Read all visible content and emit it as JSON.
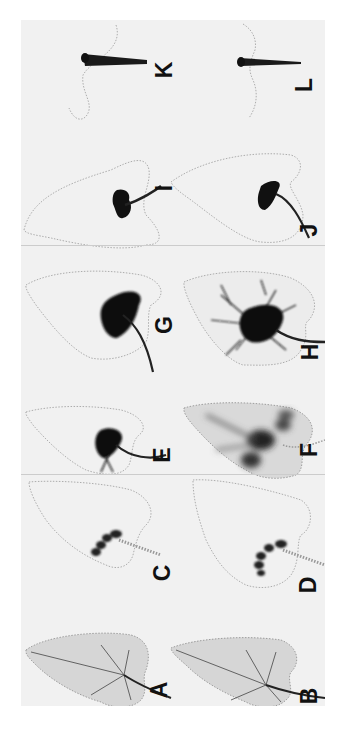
{
  "figure": {
    "orientation": "rotated 90 degrees counter-clockwise",
    "rows": 3,
    "panels": [
      {
        "id": "A",
        "label": "A",
        "description": "whole leaf, light grey with visible veins and petiole"
      },
      {
        "id": "B",
        "label": "B",
        "description": "whole leaf, light grey with visible veins and petiole"
      },
      {
        "id": "C",
        "label": "C",
        "description": "dotted leaf outline with small dark spots near base"
      },
      {
        "id": "D",
        "label": "D",
        "description": "dotted leaf outline with small dark spots near base"
      },
      {
        "id": "E",
        "label": "E",
        "description": "dotted leaf outline with dark central label spreading into veins"
      },
      {
        "id": "F",
        "label": "F",
        "description": "leaf with diffuse grey label throughout lamina, dark patches"
      },
      {
        "id": "G",
        "label": "G",
        "description": "dotted leaf outline with dark central blotch and dark petiole"
      },
      {
        "id": "H",
        "label": "H",
        "description": "leaf with extensive dark branching vein label and dark petiole"
      },
      {
        "id": "I",
        "label": "I",
        "description": "dotted leaf outline with dark spot at base and petiole"
      },
      {
        "id": "J",
        "label": "J",
        "description": "dotted leaf outline with dark spot at base and curved petiole"
      },
      {
        "id": "K",
        "label": "K",
        "description": "dotted leaf outline with dark petiole only"
      },
      {
        "id": "L",
        "label": "L",
        "description": "dotted leaf outline with dark petiole only"
      }
    ]
  },
  "labels": {
    "A": "A",
    "B": "B",
    "C": "C",
    "D": "D",
    "E": "E",
    "F": "F",
    "G": "G",
    "H": "H",
    "I": "I",
    "J": "J",
    "K": "K",
    "L": "L"
  },
  "colors": {
    "background": "#ffffff",
    "panel": "#f1f1f1",
    "label_ink": "#111111",
    "outline_dots": "#8a8a8a",
    "leaf_tint": "#d6d6d6"
  }
}
